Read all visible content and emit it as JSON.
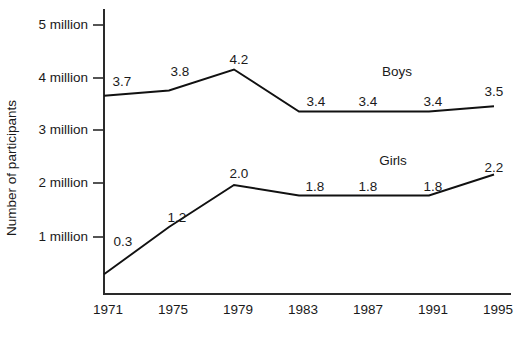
{
  "chart_data": {
    "type": "line",
    "title": "",
    "xlabel": "",
    "ylabel": "Number of participants",
    "categories": [
      "1971",
      "1975",
      "1979",
      "1983",
      "1987",
      "1991",
      "1995"
    ],
    "x": [
      1971,
      1975,
      1979,
      1983,
      1987,
      1991,
      1995
    ],
    "series": [
      {
        "name": "Boys",
        "values": [
          3.7,
          3.8,
          4.2,
          3.4,
          3.4,
          3.4,
          3.5
        ],
        "labels": [
          "3.7",
          "3.8",
          "4.2",
          "3.4",
          "3.4",
          "3.4",
          "3.5"
        ]
      },
      {
        "name": "Girls",
        "values": [
          0.3,
          1.2,
          2.0,
          1.8,
          1.8,
          1.8,
          2.2
        ],
        "labels": [
          "0.3",
          "1.2",
          "2.0",
          "1.8",
          "1.8",
          "1.8",
          "2.2"
        ]
      }
    ],
    "ytick_labels": [
      "5 million",
      "4 million",
      "3 million",
      "2 million",
      "1 million"
    ],
    "ytick_values": [
      5,
      4,
      3,
      2,
      1
    ],
    "ylim": [
      0,
      5.5
    ],
    "xlim": [
      1971,
      1995
    ],
    "grid": false,
    "legend": "inline-series-labels",
    "units": "millions of participants",
    "line_color": "#111111",
    "axis_color": "#2a2a2a",
    "background_color": "#ffffff"
  },
  "layout": {
    "plot_left_px": 104,
    "plot_right_px": 510,
    "baseline_px": 294,
    "axis_top_px": 10,
    "px_per_million": 52.5,
    "y_zero_px": 290,
    "x_step_px": 65
  },
  "series_label_positions": {
    "boys": {
      "x": 397,
      "y": 76
    },
    "girls": {
      "x": 393,
      "y": 165
    }
  },
  "point_label_positions": {
    "boys": [
      {
        "x": 122,
        "y": 86
      },
      {
        "x": 180,
        "y": 76
      },
      {
        "x": 239,
        "y": 64
      },
      {
        "x": 316,
        "y": 106
      },
      {
        "x": 368,
        "y": 106
      },
      {
        "x": 433,
        "y": 106
      },
      {
        "x": 494,
        "y": 96
      }
    ],
    "girls": [
      {
        "x": 123,
        "y": 246
      },
      {
        "x": 177,
        "y": 222
      },
      {
        "x": 239,
        "y": 178
      },
      {
        "x": 315,
        "y": 191
      },
      {
        "x": 368,
        "y": 191
      },
      {
        "x": 433,
        "y": 191
      },
      {
        "x": 494,
        "y": 172
      }
    ]
  }
}
